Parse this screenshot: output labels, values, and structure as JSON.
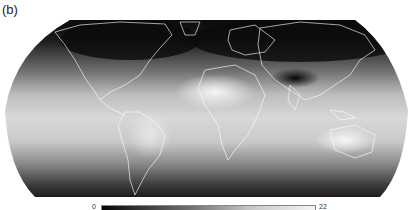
{
  "figure": {
    "panel_label": "(b)",
    "projection": "robinson",
    "colormap": "grayscale (dark = low, light = high)",
    "colorbar": {
      "min_label": "0",
      "max_label": "22",
      "orientation": "horizontal"
    },
    "regions": [
      {
        "name": "north-america",
        "tone": "dark"
      },
      {
        "name": "south-america",
        "tone": "light"
      },
      {
        "name": "europe",
        "tone": "dark"
      },
      {
        "name": "africa",
        "tone": "light"
      },
      {
        "name": "asia",
        "tone": "dark"
      },
      {
        "name": "tibetan-plateau",
        "tone": "very-dark"
      },
      {
        "name": "australia",
        "tone": "light"
      },
      {
        "name": "tropics",
        "tone": "light"
      },
      {
        "name": "southern-ocean",
        "tone": "dark"
      }
    ],
    "colors": {
      "low": "#050505",
      "mid": "#7a7a7a",
      "high": "#f4f4f4",
      "coastline": "#ffffff"
    }
  }
}
